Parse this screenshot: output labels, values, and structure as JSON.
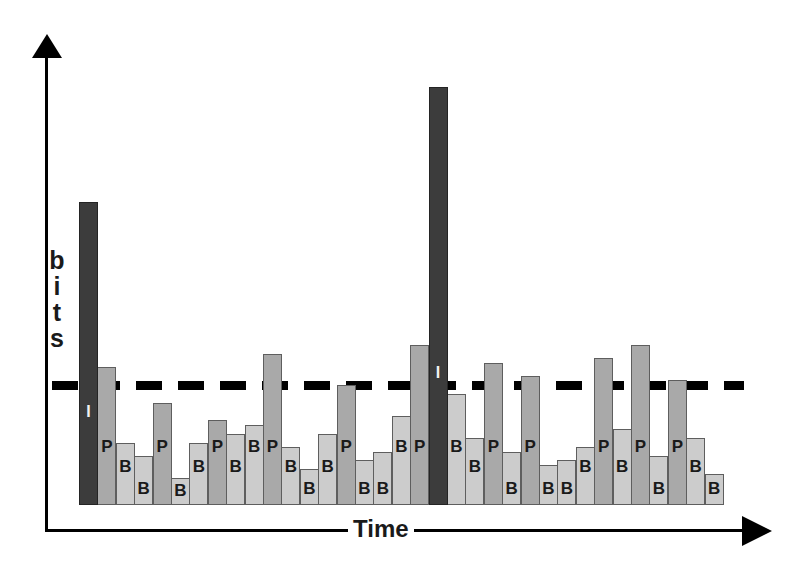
{
  "chart_data": {
    "type": "bar",
    "title": "",
    "subtitle": "",
    "xlabel": "Time",
    "ylabel": "bits",
    "ylabel_chars": [
      "b",
      "i",
      "t",
      "s"
    ],
    "grid": false,
    "legend_position": "none",
    "ylim": [
      0,
      100
    ],
    "annotations": [
      {
        "name": "bitrate-threshold",
        "kind": "horizontal-dashed-line",
        "value": 27,
        "style": "dashed",
        "color": "#000000",
        "label": ""
      }
    ],
    "series_description": "Per-frame encoded size for an MPEG-style GOP pattern; frame type shown as the in-bar data label.",
    "frame_type_colors": {
      "I": "#3c3c3c",
      "P": "#a9a9a9",
      "B": "#cccccc"
    },
    "frame_type_legend": [
      {
        "code": "I",
        "label": "I"
      },
      {
        "code": "P",
        "label": "P"
      },
      {
        "code": "B",
        "label": "B"
      }
    ],
    "categories": [
      1,
      2,
      3,
      4,
      5,
      6,
      7,
      8,
      9,
      10,
      11,
      12,
      13,
      14,
      15,
      16,
      17,
      18,
      19,
      20,
      21,
      22,
      23,
      24,
      25,
      26,
      27,
      28,
      29,
      30,
      31,
      32,
      33,
      34,
      35
    ],
    "values": [
      68,
      31,
      14,
      11,
      23,
      6,
      14,
      19,
      16,
      18,
      34,
      13,
      8,
      16,
      27,
      10,
      12,
      20,
      36,
      94,
      25,
      15,
      32,
      12,
      29,
      9,
      10,
      13,
      33,
      17,
      36,
      11,
      28,
      15,
      7
    ],
    "labels": [
      "I",
      "P",
      "B",
      "B",
      "P",
      "B",
      "B",
      "P",
      "B",
      "B",
      "P",
      "B",
      "B",
      "B",
      "P",
      "B",
      "B",
      "B",
      "P",
      "I",
      "B",
      "B",
      "P",
      "B",
      "P",
      "B",
      "B",
      "B",
      "P",
      "B",
      "P",
      "B",
      "P",
      "B",
      "B"
    ],
    "bars": [
      {
        "i": 1,
        "type": "I",
        "label": "I",
        "value": 68
      },
      {
        "i": 2,
        "type": "P",
        "label": "P",
        "value": 31
      },
      {
        "i": 3,
        "type": "B",
        "label": "B",
        "value": 14
      },
      {
        "i": 4,
        "type": "B",
        "label": "B",
        "value": 11
      },
      {
        "i": 5,
        "type": "P",
        "label": "P",
        "value": 23
      },
      {
        "i": 6,
        "type": "B",
        "label": "B",
        "value": 6
      },
      {
        "i": 7,
        "type": "B",
        "label": "B",
        "value": 14
      },
      {
        "i": 8,
        "type": "P",
        "label": "P",
        "value": 19
      },
      {
        "i": 9,
        "type": "B",
        "label": "B",
        "value": 16
      },
      {
        "i": 10,
        "type": "B",
        "label": "B",
        "value": 18
      },
      {
        "i": 11,
        "type": "P",
        "label": "P",
        "value": 34
      },
      {
        "i": 12,
        "type": "B",
        "label": "B",
        "value": 13
      },
      {
        "i": 13,
        "type": "B",
        "label": "B",
        "value": 8
      },
      {
        "i": 14,
        "type": "B",
        "label": "B",
        "value": 16
      },
      {
        "i": 15,
        "type": "P",
        "label": "P",
        "value": 27
      },
      {
        "i": 16,
        "type": "B",
        "label": "B",
        "value": 10
      },
      {
        "i": 17,
        "type": "B",
        "label": "B",
        "value": 12
      },
      {
        "i": 18,
        "type": "B",
        "label": "B",
        "value": 20
      },
      {
        "i": 19,
        "type": "P",
        "label": "P",
        "value": 36
      },
      {
        "i": 20,
        "type": "I",
        "label": "I",
        "value": 94
      },
      {
        "i": 21,
        "type": "B",
        "label": "B",
        "value": 25
      },
      {
        "i": 22,
        "type": "B",
        "label": "B",
        "value": 15
      },
      {
        "i": 23,
        "type": "P",
        "label": "P",
        "value": 32
      },
      {
        "i": 24,
        "type": "B",
        "label": "B",
        "value": 12
      },
      {
        "i": 25,
        "type": "P",
        "label": "P",
        "value": 29
      },
      {
        "i": 26,
        "type": "B",
        "label": "B",
        "value": 9
      },
      {
        "i": 27,
        "type": "B",
        "label": "B",
        "value": 10
      },
      {
        "i": 28,
        "type": "B",
        "label": "B",
        "value": 13
      },
      {
        "i": 29,
        "type": "P",
        "label": "P",
        "value": 33
      },
      {
        "i": 30,
        "type": "B",
        "label": "B",
        "value": 17
      },
      {
        "i": 31,
        "type": "P",
        "label": "P",
        "value": 36
      },
      {
        "i": 32,
        "type": "B",
        "label": "B",
        "value": 11
      },
      {
        "i": 33,
        "type": "P",
        "label": "P",
        "value": 28
      },
      {
        "i": 34,
        "type": "B",
        "label": "B",
        "value": 15
      },
      {
        "i": 35,
        "type": "B",
        "label": "B",
        "value": 7
      }
    ]
  },
  "axes": {
    "y_arrow": "arrow-up-icon",
    "x_arrow": "arrow-right-icon"
  }
}
